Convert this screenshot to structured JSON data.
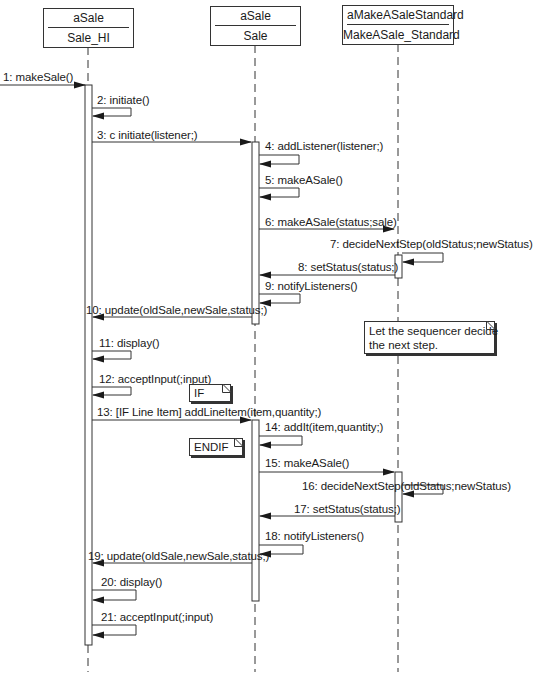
{
  "objects": [
    {
      "name": "aSale",
      "class": "Sale_HI"
    },
    {
      "name": "aSale",
      "class": "Sale"
    },
    {
      "name": "aMakeASaleStandard",
      "class": "MakeASale_Standard"
    }
  ],
  "messages": [
    {
      "n": "1",
      "label": "1: makeSale()",
      "from": "external",
      "to": "Sale_HI"
    },
    {
      "n": "2",
      "label": "2: initiate()",
      "from": "Sale_HI",
      "to": "Sale_HI"
    },
    {
      "n": "3",
      "label": "3: c initiate(listener;)",
      "from": "Sale_HI",
      "to": "Sale"
    },
    {
      "n": "4",
      "label": "4: addListener(listener;)",
      "from": "Sale",
      "to": "Sale"
    },
    {
      "n": "5",
      "label": "5: makeASale()",
      "from": "Sale",
      "to": "Sale"
    },
    {
      "n": "6",
      "label": "6: makeASale(status;sale)",
      "from": "Sale",
      "to": "MakeASale_Standard"
    },
    {
      "n": "7",
      "label": "7: decideNextStep(oldStatus;newStatus)",
      "from": "MakeASale_Standard",
      "to": "MakeASale_Standard"
    },
    {
      "n": "8",
      "label": "8: setStatus(status;)",
      "from": "MakeASale_Standard",
      "to": "Sale"
    },
    {
      "n": "9",
      "label": "9: notifyListeners()",
      "from": "Sale",
      "to": "Sale"
    },
    {
      "n": "10",
      "label": "10: update(oldSale,newSale,status;)",
      "from": "Sale",
      "to": "Sale_HI"
    },
    {
      "n": "11",
      "label": "11: display()",
      "from": "Sale_HI",
      "to": "Sale_HI"
    },
    {
      "n": "12",
      "label": "12: acceptInput(;input)",
      "from": "Sale_HI",
      "to": "Sale_HI"
    },
    {
      "n": "13",
      "label": "13: [IF Line Item] addLineItem(item,quantity;)",
      "from": "Sale_HI",
      "to": "Sale"
    },
    {
      "n": "14",
      "label": "14: addIt(item,quantity;)",
      "from": "Sale",
      "to": "Sale"
    },
    {
      "n": "15",
      "label": "15: makeASale()",
      "from": "Sale",
      "to": "MakeASale_Standard"
    },
    {
      "n": "16",
      "label": "16: decideNextStep(oldStatus;newStatus)",
      "from": "MakeASale_Standard",
      "to": "MakeASale_Standard"
    },
    {
      "n": "17",
      "label": "17: setStatus(status;)",
      "from": "MakeASale_Standard",
      "to": "Sale"
    },
    {
      "n": "18",
      "label": "18: notifyListeners()",
      "from": "Sale",
      "to": "Sale"
    },
    {
      "n": "19",
      "label": "19: update(oldSale,newSale,status;)",
      "from": "Sale",
      "to": "Sale_HI"
    },
    {
      "n": "20",
      "label": "20: display()",
      "from": "Sale_HI",
      "to": "Sale_HI"
    },
    {
      "n": "21",
      "label": "21: acceptInput(;input)",
      "from": "Sale_HI",
      "to": "Sale_HI"
    }
  ],
  "notes": {
    "sequencer_line1": "Let the sequencer decide",
    "sequencer_line2": "the next step.",
    "if": "IF",
    "endif": "ENDIF"
  },
  "colors": {
    "line": "#333333",
    "background": "#ffffff"
  }
}
